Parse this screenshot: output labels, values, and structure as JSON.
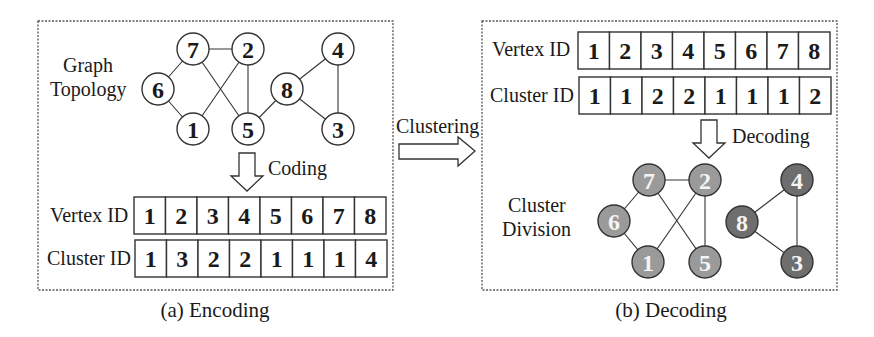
{
  "encoding": {
    "caption": "(a) Encoding",
    "graph_label_line1": "Graph",
    "graph_label_line2": "Topology",
    "arrow_label": "Coding",
    "table": {
      "row1_label": "Vertex ID",
      "row2_label": "Cluster ID",
      "vertex_ids": [
        "1",
        "2",
        "3",
        "4",
        "5",
        "6",
        "7",
        "8"
      ],
      "cluster_ids": [
        "1",
        "3",
        "2",
        "2",
        "1",
        "1",
        "1",
        "4"
      ]
    },
    "nodes": [
      {
        "id": "7",
        "x": 193,
        "y": 49
      },
      {
        "id": "2",
        "x": 248,
        "y": 49
      },
      {
        "id": "4",
        "x": 338,
        "y": 49
      },
      {
        "id": "6",
        "x": 158,
        "y": 89
      },
      {
        "id": "8",
        "x": 287,
        "y": 89
      },
      {
        "id": "1",
        "x": 193,
        "y": 129
      },
      {
        "id": "5",
        "x": 248,
        "y": 129
      },
      {
        "id": "3",
        "x": 338,
        "y": 129
      }
    ],
    "edges": [
      [
        "7",
        "2"
      ],
      [
        "7",
        "6"
      ],
      [
        "7",
        "5"
      ],
      [
        "6",
        "1"
      ],
      [
        "2",
        "1"
      ],
      [
        "2",
        "5"
      ],
      [
        "5",
        "8"
      ],
      [
        "8",
        "4"
      ],
      [
        "8",
        "3"
      ],
      [
        "4",
        "3"
      ]
    ]
  },
  "clustering_label": "Clustering",
  "decoding": {
    "caption": "(b) Decoding",
    "arrow_label": "Decoding",
    "division_label_line1": "Cluster",
    "division_label_line2": "Division",
    "table": {
      "row1_label": "Vertex ID",
      "row2_label": "Cluster ID",
      "vertex_ids": [
        "1",
        "2",
        "3",
        "4",
        "5",
        "6",
        "7",
        "8"
      ],
      "cluster_ids": [
        "1",
        "1",
        "2",
        "2",
        "1",
        "1",
        "1",
        "2"
      ]
    },
    "cluster_colors": {
      "1": "#9a9a9a",
      "2": "#6e6e6e"
    },
    "nodes": [
      {
        "id": "7",
        "x": 649,
        "y": 180,
        "cluster": "1"
      },
      {
        "id": "2",
        "x": 705,
        "y": 180,
        "cluster": "1"
      },
      {
        "id": "4",
        "x": 797,
        "y": 180,
        "cluster": "2"
      },
      {
        "id": "6",
        "x": 614,
        "y": 221,
        "cluster": "1"
      },
      {
        "id": "8",
        "x": 742,
        "y": 222,
        "cluster": "2"
      },
      {
        "id": "1",
        "x": 648,
        "y": 262,
        "cluster": "1"
      },
      {
        "id": "5",
        "x": 705,
        "y": 262,
        "cluster": "1"
      },
      {
        "id": "3",
        "x": 797,
        "y": 262,
        "cluster": "2"
      }
    ],
    "edges": [
      [
        "7",
        "2"
      ],
      [
        "7",
        "6"
      ],
      [
        "7",
        "5"
      ],
      [
        "6",
        "1"
      ],
      [
        "2",
        "1"
      ],
      [
        "2",
        "5"
      ],
      [
        "8",
        "4"
      ],
      [
        "8",
        "3"
      ],
      [
        "4",
        "3"
      ]
    ]
  }
}
